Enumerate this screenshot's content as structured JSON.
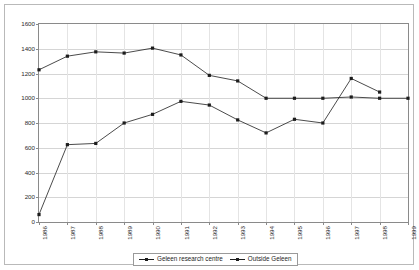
{
  "chart_data": {
    "type": "line",
    "title": "",
    "xlabel": "",
    "ylabel": "",
    "ylim": [
      0,
      1600
    ],
    "ytick_step": 200,
    "yticks": [
      0,
      200,
      400,
      600,
      800,
      1000,
      1200,
      1400,
      1600
    ],
    "grid": true,
    "legend_position": "bottom",
    "categories": [
      "1986",
      "1987",
      "1988",
      "1989",
      "1990",
      "1991",
      "1992",
      "1993",
      "1994",
      "1995",
      "1996",
      "1997",
      "1998",
      "1999"
    ],
    "series": [
      {
        "name": "Geleen research centre",
        "marker": "square",
        "color": "#1d1d1d",
        "values": [
          1230,
          1340,
          1375,
          1365,
          1405,
          1350,
          1185,
          1140,
          1000,
          1000,
          1000,
          1010,
          1000,
          1000
        ]
      },
      {
        "name": "Outside Geleen",
        "marker": "square",
        "color": "#1d1d1d",
        "values": [
          60,
          625,
          635,
          800,
          870,
          975,
          945,
          825,
          720,
          830,
          800,
          1160,
          1050,
          null
        ]
      }
    ]
  },
  "legend": {
    "items": [
      {
        "label": "Geleen research centre"
      },
      {
        "label": "Outside Geleen"
      }
    ]
  }
}
